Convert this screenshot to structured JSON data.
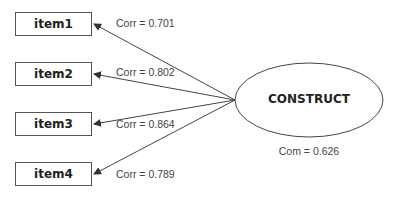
{
  "diagram": {
    "construct": {
      "label": "CONSTRUCT",
      "com_label": "Com = 0.626"
    },
    "items": [
      {
        "label": "item1",
        "corr_label": "Corr = 0.701"
      },
      {
        "label": "item2",
        "corr_label": "Corr = 0.802"
      },
      {
        "label": "item3",
        "corr_label": "Corr = 0.864"
      },
      {
        "label": "item4",
        "corr_label": "Corr = 0.789"
      }
    ],
    "colors": {
      "line": "#444444",
      "text": "#222222",
      "label": "#444444"
    }
  }
}
